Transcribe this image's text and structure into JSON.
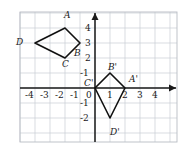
{
  "chart_data": {
    "type": "scatter",
    "title": "",
    "xlabel": "",
    "ylabel": "",
    "grid": true,
    "legend": "none",
    "xlim": [
      -4.6,
      4.6
    ],
    "ylim": [
      -2.6,
      4.6
    ],
    "x_ticks": [
      "-4",
      "-3",
      "-2",
      "-1",
      "0",
      "1",
      "2",
      "3",
      "4"
    ],
    "x_tick_values": [
      -4,
      -3,
      -2,
      -1,
      0,
      1,
      2,
      3,
      4
    ],
    "y_ticks": [
      "4",
      "3",
      "2",
      "-1",
      "-1",
      "-2"
    ],
    "y_tick_values": [
      4,
      3,
      2,
      1,
      -1,
      -2
    ],
    "series": [
      {
        "name": "ABCD",
        "closed": true,
        "points": [
          {
            "label": "A",
            "x": -2,
            "y": 4
          },
          {
            "label": "B",
            "x": -1,
            "y": 3
          },
          {
            "label": "C",
            "x": -2,
            "y": 2
          },
          {
            "label": "D",
            "x": -4,
            "y": 3
          }
        ]
      },
      {
        "name": "A'B'C'D'",
        "closed": true,
        "points": [
          {
            "label": "A'",
            "x": 2,
            "y": 0
          },
          {
            "label": "B'",
            "x": 1,
            "y": 1
          },
          {
            "label": "C'",
            "x": 0,
            "y": 0
          },
          {
            "label": "D'",
            "x": 1,
            "y": -2
          }
        ]
      }
    ]
  },
  "axis_labels": {
    "x_neg_4": "-4",
    "x_neg_3": "-3",
    "x_neg_2": "-2",
    "x_neg_1": "-1",
    "origin": "0",
    "x_pos_1": "1",
    "x_pos_2": "2",
    "x_pos_3": "3",
    "x_pos_4": "4",
    "y_pos_4": "4",
    "y_pos_3": "3",
    "y_pos_2": "2",
    "y_pos_1": "-1",
    "y_neg_1": "-1",
    "y_neg_2": "-2"
  },
  "vertex_labels": {
    "a": "A",
    "b": "B",
    "c": "C",
    "d": "D",
    "a_prime": "A'",
    "b_prime": "B'",
    "c_prime": "C'",
    "d_prime": "D'"
  },
  "colors": {
    "grid": "#c9cdd4",
    "axis": "#1a1a1a",
    "shape": "#111111",
    "border": "#b8bcc3",
    "background": "#ffffff"
  }
}
